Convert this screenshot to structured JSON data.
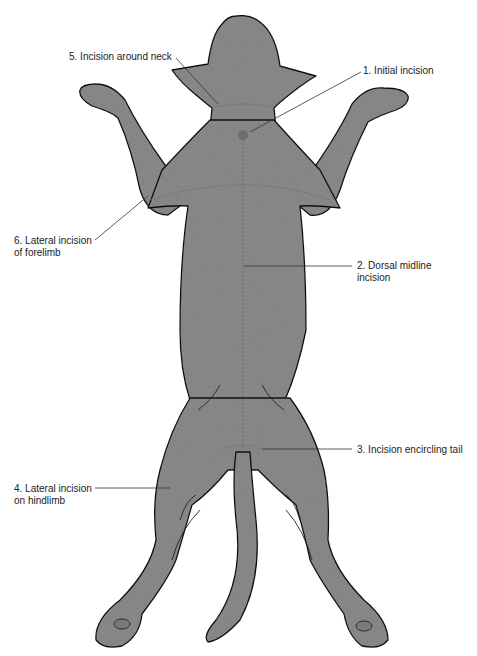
{
  "figure": {
    "colors": {
      "body_fill": "#8a8a8a",
      "outline": "#111111",
      "incision_dot": "#6e6e6e",
      "leader": "#333333"
    }
  },
  "labels": [
    {
      "id": "1",
      "lines": [
        "1. Initial incision"
      ]
    },
    {
      "id": "2",
      "lines": [
        "2. Dorsal midline",
        "incision"
      ]
    },
    {
      "id": "3",
      "lines": [
        "3. Incision encircling tail"
      ]
    },
    {
      "id": "4",
      "lines": [
        "4. Lateral incision",
        "on hindlimb"
      ]
    },
    {
      "id": "5",
      "lines": [
        "5. Incision around neck"
      ]
    },
    {
      "id": "6",
      "lines": [
        "6. Lateral incision",
        "of forelimb"
      ]
    }
  ]
}
